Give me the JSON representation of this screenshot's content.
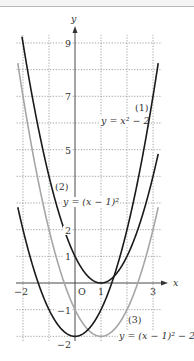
{
  "chart_data": {
    "type": "line",
    "title": "",
    "xlabel": "x",
    "ylabel": "y",
    "xlim": [
      -2.25,
      3.2
    ],
    "ylim": [
      -2.1,
      9.3
    ],
    "grid": true,
    "x_tick_labels": [
      "-2",
      "O",
      "1",
      "3"
    ],
    "y_tick_labels": [
      "9",
      "7",
      "5",
      "2",
      "1",
      "-1",
      "-2"
    ],
    "series": [
      {
        "name": "(1)",
        "label": "y = x² − 2",
        "color": "#1a1a1a",
        "formula": "x^2-2",
        "vertex": [
          0,
          -2
        ]
      },
      {
        "name": "(2)",
        "label": "y = (x − 1)²",
        "color": "#1a1a1a",
        "formula": "(x-1)^2",
        "vertex": [
          1,
          0
        ]
      },
      {
        "name": "(3)",
        "label": "y = (x − 1)² − 2",
        "color": "#a6a6a6",
        "formula": "(x-1)^2-2",
        "vertex": [
          1,
          -2
        ]
      }
    ]
  },
  "axes": {
    "x_name": "x",
    "y_name": "y",
    "origin": "O"
  },
  "ticks": {
    "x": {
      "m2": "−2",
      "p1": "1",
      "p3": "3"
    },
    "y": {
      "p9": "9",
      "p7": "7",
      "p5": "5",
      "p2": "2",
      "p1": "1",
      "m1": "−1",
      "m2": "−2"
    }
  },
  "labels": {
    "c1_num": "(1)",
    "c1_eq": "y = x² − 2",
    "c2_num": "(2)",
    "c2_eq": "y = (x − 1)²",
    "c3_num": "(3)",
    "c3_eq": "y = (x − 1)² − 2"
  }
}
